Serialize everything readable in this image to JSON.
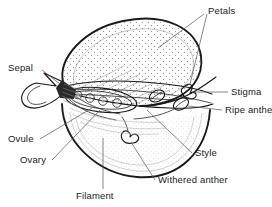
{
  "figure": {
    "background_color": "#ffffff",
    "ink_color": "#1a1a1a",
    "leader_color": "#555555",
    "width": 272,
    "height": 207
  },
  "labels": {
    "petals": "Petals",
    "sepal": "Sepal",
    "stigma": "Stigma",
    "ripe_anther": "Ripe anther",
    "ovule": "Ovule",
    "ovary": "Ovary",
    "style": "Style",
    "withered_anther": "Withered anther",
    "filament": "Filament"
  },
  "parts": [
    {
      "name": "petals",
      "label": "Petals",
      "side": "top-right",
      "leaders": 2
    },
    {
      "name": "sepal",
      "label": "Sepal",
      "side": "left",
      "leaders": 1
    },
    {
      "name": "stigma",
      "label": "Stigma",
      "side": "right",
      "leaders": 1
    },
    {
      "name": "ripe-anther",
      "label": "Ripe anther",
      "side": "right",
      "leaders": 1
    },
    {
      "name": "ovule",
      "label": "Ovule",
      "side": "bottom-left",
      "leaders": 1
    },
    {
      "name": "ovary",
      "label": "Ovary",
      "side": "bottom-left",
      "leaders": 1
    },
    {
      "name": "style",
      "label": "Style",
      "side": "bottom-right",
      "leaders": 1
    },
    {
      "name": "withered-anther",
      "label": "Withered anther",
      "side": "bottom-right",
      "leaders": 1
    },
    {
      "name": "filament",
      "label": "Filament",
      "side": "bottom",
      "leaders": 1
    }
  ],
  "ovule_count": 4
}
